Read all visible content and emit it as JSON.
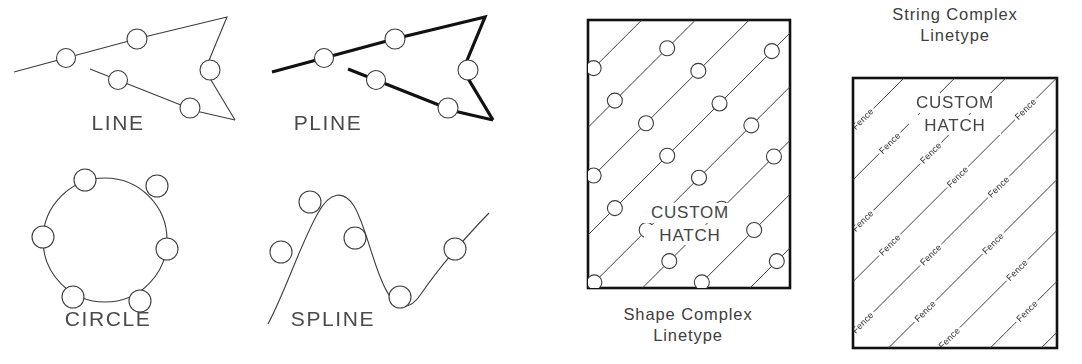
{
  "figure": {
    "background": "#ffffff",
    "ink": "#3c3c3c",
    "heavy_ink": "#111111"
  },
  "entities": [
    {
      "name": "line",
      "label": "LINE",
      "label_pos": {
        "x": 118,
        "y": 130
      },
      "stroke": "thin",
      "path": "M 14 72 L 140 38 L 227 17 L 205 70 L 235 120",
      "path2": "M 90 69 L 196 111 L 235 120",
      "markers": [
        {
          "cx": 66,
          "cy": 58,
          "r": 9.5
        },
        {
          "cx": 137,
          "cy": 39,
          "r": 10
        },
        {
          "cx": 210,
          "cy": 70,
          "r": 10
        },
        {
          "cx": 118,
          "cy": 80,
          "r": 9.5
        },
        {
          "cx": 190,
          "cy": 108,
          "r": 10
        }
      ]
    },
    {
      "name": "pline",
      "label": "PLINE",
      "label_pos": {
        "x": 328,
        "y": 130
      },
      "stroke": "heavy",
      "path": "M 272 72 L 398 38 L 485 17 L 463 70 L 493 120",
      "path2": "M 348 69 L 454 111 L 493 120",
      "markers": [
        {
          "cx": 324,
          "cy": 58,
          "r": 9.5
        },
        {
          "cx": 395,
          "cy": 39,
          "r": 10
        },
        {
          "cx": 468,
          "cy": 70,
          "r": 10
        },
        {
          "cx": 376,
          "cy": 80,
          "r": 9.5
        },
        {
          "cx": 448,
          "cy": 108,
          "r": 10
        }
      ]
    },
    {
      "name": "circle",
      "label": "CIRCLE",
      "label_pos": {
        "x": 108,
        "y": 326
      },
      "stroke": "thin",
      "geometry": {
        "cx": 105,
        "cy": 240,
        "r": 62
      },
      "markers": [
        {
          "cx": 85,
          "cy": 180,
          "r": 11
        },
        {
          "cx": 157,
          "cy": 186,
          "r": 11
        },
        {
          "cx": 43,
          "cy": 237,
          "r": 11
        },
        {
          "cx": 167,
          "cy": 249,
          "r": 11
        },
        {
          "cx": 73,
          "cy": 297,
          "r": 11
        },
        {
          "cx": 140,
          "cy": 301,
          "r": 11
        }
      ]
    },
    {
      "name": "spline",
      "label": "SPLINE",
      "label_pos": {
        "x": 333,
        "y": 326
      },
      "stroke": "thin",
      "path": "M 268 324 C 286 290 300 245 318 213 C 330 191 344 190 354 206 C 366 226 372 262 385 288 C 396 310 409 312 421 294 C 436 272 460 243 489 213",
      "markers": [
        {
          "cx": 281,
          "cy": 252,
          "r": 11
        },
        {
          "cx": 310,
          "cy": 202,
          "r": 11
        },
        {
          "cx": 355,
          "cy": 238,
          "r": 11
        },
        {
          "cx": 400,
          "cy": 297,
          "r": 11
        },
        {
          "cx": 455,
          "cy": 249,
          "r": 11
        }
      ]
    }
  ],
  "shape_panel": {
    "name": "shape-complex-linetype",
    "caption_line1": "Shape Complex",
    "caption_line2": "Linetype",
    "caption_pos": {
      "x": 688,
      "y": 320
    },
    "box": {
      "x": 588,
      "y": 20,
      "width": 202,
      "height": 268
    },
    "hatch": {
      "angle_deg": 45,
      "spacing": 38,
      "marker_radius": 7.5,
      "description": "diagonal lines with inline circles"
    },
    "inner_label_line1": "CUSTOM",
    "inner_label_line2": "HATCH",
    "inner_label_pos": {
      "x": 690,
      "y": 218
    }
  },
  "string_panel": {
    "name": "string-complex-linetype",
    "caption_line1": "String Complex",
    "caption_line2": "Linetype",
    "caption_pos": {
      "x": 955,
      "y": 20
    },
    "box": {
      "x": 853,
      "y": 78,
      "width": 204,
      "height": 270
    },
    "hatch": {
      "angle_deg": 45,
      "spacing": 36,
      "word": "Fence",
      "description": "diagonal lines interrupted by the word Fence"
    },
    "inner_label_line1": "CUSTOM",
    "inner_label_line2": "HATCH",
    "inner_label_pos": {
      "x": 955,
      "y": 108
    }
  }
}
